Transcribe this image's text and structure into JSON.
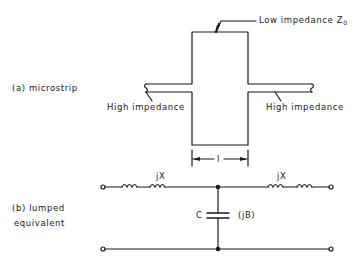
{
  "diagram": {
    "type": "microstrip-stub-and-lumped-equivalent",
    "colors": {
      "line": "#1a1a1a",
      "background": "#ffffff"
    },
    "part_a": {
      "caption": "(a) microstrip",
      "low_impedance_label": "Low impedance Z",
      "low_impedance_subscript": "0",
      "high_impedance_left_label": "High impedance",
      "high_impedance_right_label": "High impedance",
      "length_label": "l"
    },
    "part_b": {
      "caption_line1": "(b) lumped",
      "caption_line2": "equivalent",
      "left_reactance_label": "jX",
      "right_reactance_label": "jX",
      "capacitor_label": "C",
      "susceptance_label": "(jB)"
    }
  }
}
